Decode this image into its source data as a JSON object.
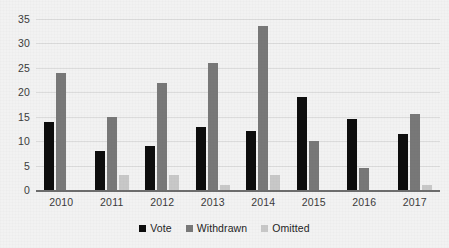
{
  "chart_data": {
    "type": "bar",
    "title": "",
    "xlabel": "",
    "ylabel": "",
    "categories": [
      "2010",
      "2011",
      "2012",
      "2013",
      "2014",
      "2015",
      "2016",
      "2017"
    ],
    "series": [
      {
        "name": "Vote",
        "color": "#0d0d0d",
        "values": [
          14,
          8,
          9,
          13,
          12,
          19,
          14.5,
          11.5
        ]
      },
      {
        "name": "Withdrawn",
        "color": "#787878",
        "values": [
          24,
          15,
          22,
          26,
          33.5,
          10,
          4.5,
          15.5
        ]
      },
      {
        "name": "Omitted",
        "color": "#c8c8c8",
        "values": [
          0,
          3,
          3,
          1,
          3,
          0,
          0,
          1
        ]
      }
    ],
    "ylim": [
      0,
      35
    ],
    "yticks": [
      0,
      5,
      10,
      15,
      20,
      25,
      30,
      35
    ],
    "ytick_labels": [
      "0",
      "5",
      "10",
      "15",
      "20",
      "25",
      "30",
      "35"
    ],
    "grid": true,
    "legend_position": "bottom"
  },
  "legend": {
    "items": [
      {
        "label": "Vote",
        "color": "#0d0d0d"
      },
      {
        "label": "Withdrawn",
        "color": "#787878"
      },
      {
        "label": "Omitted",
        "color": "#c8c8c8"
      }
    ]
  }
}
